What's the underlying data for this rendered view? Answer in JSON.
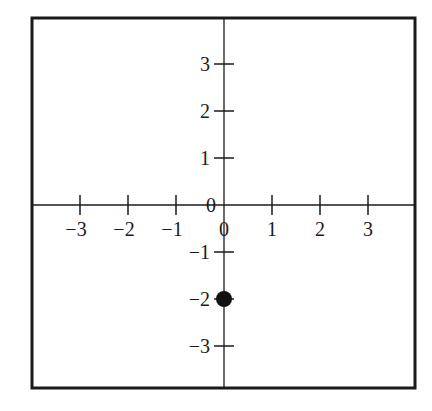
{
  "chart_data": {
    "type": "scatter",
    "title": "",
    "xlabel": "",
    "ylabel": "",
    "xlim": [
      -4,
      4
    ],
    "ylim": [
      -4,
      4
    ],
    "grid": false,
    "legend": null,
    "x_ticks": [
      -3,
      -2,
      -1,
      0,
      1,
      2,
      3
    ],
    "y_ticks": [
      -3,
      -2,
      -1,
      0,
      1,
      2,
      3
    ],
    "x_tick_labels": [
      "−3",
      "−2",
      "−1",
      "0",
      "1",
      "2",
      "3"
    ],
    "y_tick_labels": [
      "−3",
      "−2",
      "−1",
      "0",
      "1",
      "2",
      "3"
    ],
    "series": [
      {
        "name": "point",
        "x": [
          0
        ],
        "y": [
          -2
        ],
        "marker": "filled-circle",
        "color": "#111111"
      }
    ]
  },
  "layout": {
    "frame": {
      "left": 32,
      "top": 18,
      "right": 415,
      "bottom": 388
    },
    "origin": {
      "x": 224,
      "y": 205
    },
    "unit_px_x": 48,
    "unit_px_y": 47
  }
}
